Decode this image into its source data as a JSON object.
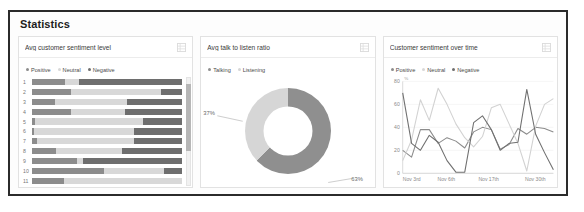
{
  "panel": {
    "title": "Statistics"
  },
  "colors": {
    "positive": "#8c8c8c",
    "neutral": "#d8d8d8",
    "negative": "#6e6e6e",
    "talking": "#8f8f8f",
    "listening": "#d6d6d6",
    "border": "#2b2b2b",
    "card_border": "#e2e2e2",
    "axis": "#8a8a8a"
  },
  "cards": [
    {
      "title": "Avg customer sentiment level",
      "menu_icon": "grid-icon",
      "legend": [
        {
          "label": "Positive",
          "color": "#8c8c8c"
        },
        {
          "label": "Neutral",
          "color": "#d8d8d8"
        },
        {
          "label": "Negative",
          "color": "#6e6e6e"
        }
      ],
      "scrollbar": {
        "thumb_top_pct": 6,
        "thumb_height_pct": 62
      }
    },
    {
      "title": "Avg talk to listen ratio",
      "menu_icon": "grid-icon",
      "legend": [
        {
          "label": "Talking",
          "color": "#8f8f8f"
        },
        {
          "label": "Listening",
          "color": "#d6d6d6"
        }
      ],
      "labels": {
        "listening": "37%",
        "talking": "63%"
      }
    },
    {
      "title": "Customer sentiment over time",
      "menu_icon": "grid-icon",
      "legend": [
        {
          "label": "Positive",
          "color": "#8c8c8c"
        },
        {
          "label": "Neutral",
          "color": "#d8d8d8"
        },
        {
          "label": "Negative",
          "color": "#6e6e6e"
        }
      ]
    }
  ],
  "chart_data": [
    {
      "type": "bar",
      "title": "Avg customer sentiment level",
      "orientation": "horizontal",
      "stacked": true,
      "xlabel": "",
      "ylabel": "",
      "categories": [
        "1",
        "2",
        "3",
        "4",
        "5",
        "6",
        "7",
        "8",
        "9",
        "10",
        "11"
      ],
      "series": [
        {
          "name": "Positive",
          "color": "#8c8c8c",
          "values": [
            22,
            26,
            15,
            26,
            2,
            1,
            3,
            16,
            30,
            48,
            21
          ]
        },
        {
          "name": "Neutral",
          "color": "#d8d8d8",
          "values": [
            9,
            60,
            48,
            36,
            72,
            67,
            65,
            44,
            4,
            40,
            79
          ]
        },
        {
          "name": "Negative",
          "color": "#6e6e6e",
          "values": [
            69,
            14,
            37,
            38,
            26,
            32,
            32,
            40,
            66,
            12,
            0
          ]
        }
      ],
      "xlim": [
        0,
        100
      ],
      "grid": false,
      "legend_position": "top-left"
    },
    {
      "type": "pie",
      "variant": "donut",
      "title": "Avg talk to listen ratio",
      "labels": [
        "Talking",
        "Listening"
      ],
      "values": [
        63,
        37
      ],
      "value_labels": [
        "63%",
        "37%"
      ],
      "colors": [
        "#8f8f8f",
        "#d6d6d6"
      ],
      "legend_position": "top-left"
    },
    {
      "type": "line",
      "title": "Customer sentiment over time",
      "xlabel": "",
      "ylabel": "%",
      "ylim": [
        0,
        80
      ],
      "yticks": [
        0,
        20,
        40,
        60,
        80
      ],
      "x": [
        "Nov 3rd",
        "Nov 6th",
        "Nov 17th",
        "Nov 30th"
      ],
      "xtick_positions_pct": [
        6,
        29,
        57,
        88
      ],
      "grid": true,
      "legend_position": "top-left",
      "series": [
        {
          "name": "Positive",
          "color": "#8c8c8c",
          "values": [
            20,
            14,
            38,
            38,
            26,
            31,
            28,
            22,
            36,
            40,
            38,
            21,
            25,
            39,
            34,
            40,
            39,
            36
          ]
        },
        {
          "name": "Neutral",
          "color": "#d2d2d2",
          "values": [
            11,
            29,
            64,
            46,
            74,
            60,
            43,
            31,
            23,
            32,
            57,
            60,
            43,
            26,
            2,
            41,
            60,
            65
          ]
        },
        {
          "name": "Negative",
          "color": "#707070",
          "values": [
            70,
            26,
            20,
            33,
            27,
            11,
            1,
            1,
            44,
            50,
            38,
            20,
            26,
            27,
            73,
            34,
            18,
            3
          ]
        }
      ]
    }
  ]
}
